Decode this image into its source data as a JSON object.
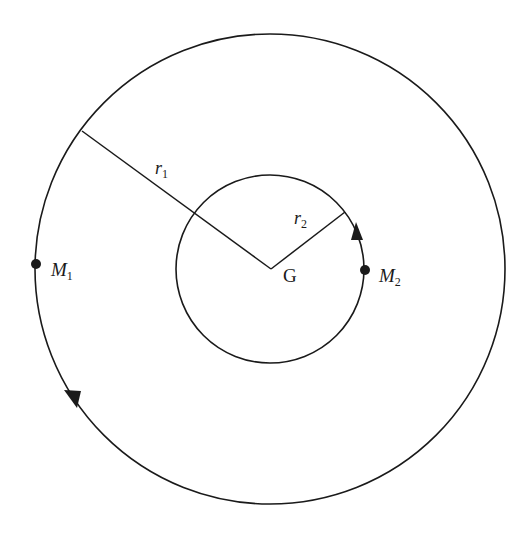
{
  "diagram": {
    "colors": {
      "stroke": "#1a1a1a",
      "background": "#ffffff"
    },
    "center": {
      "label": "G",
      "x": 270,
      "y": 269
    },
    "outer_orbit": {
      "cx": 270,
      "cy": 269,
      "r": 235,
      "direction": "counterclockwise"
    },
    "inner_orbit": {
      "cx": 270,
      "cy": 269,
      "r": 94,
      "direction": "counterclockwise"
    },
    "radius_labels": {
      "r1": {
        "main": "r",
        "sub": "1"
      },
      "r2": {
        "main": "r",
        "sub": "2"
      }
    },
    "masses": [
      {
        "id": "M1",
        "main": "M",
        "sub": "1",
        "orbit": "outer"
      },
      {
        "id": "M2",
        "main": "M",
        "sub": "2",
        "orbit": "inner"
      }
    ]
  }
}
